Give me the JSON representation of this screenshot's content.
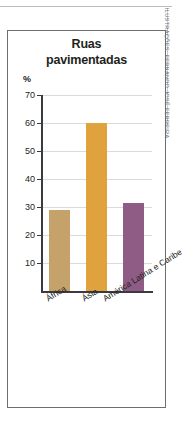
{
  "figure": {
    "title_line1": "Ruas",
    "title_line2": "pavimentadas",
    "credit": "ILUSTRAÇÕES: FERNANDO JOSÉ FERREIRA"
  },
  "chart_data": {
    "type": "bar",
    "title": "Ruas pavimentadas",
    "xlabel": "",
    "ylabel": "%",
    "ylim": [
      0,
      70
    ],
    "yticks": [
      10,
      20,
      30,
      40,
      50,
      60,
      70
    ],
    "grid": true,
    "legend": "none",
    "categories": [
      "África",
      "Ásia",
      "América Latina e Caribe"
    ],
    "values": [
      29,
      60,
      31.5
    ],
    "colors": [
      "#c4a26a",
      "#e0a23c",
      "#8e5c85"
    ]
  }
}
